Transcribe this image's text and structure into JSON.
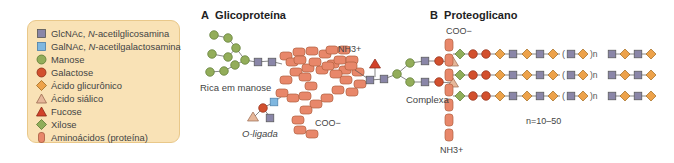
{
  "legend": {
    "items": [
      {
        "symbol": "square",
        "color": "#8a86a8",
        "abbr": "GlcNAc, ",
        "italic": "N",
        "rest": "-acetilglicosamina"
      },
      {
        "symbol": "square",
        "color": "#7fb7e0",
        "abbr": "GalNAc, ",
        "italic": "N",
        "rest": "-acetilgalactosamina"
      },
      {
        "symbol": "circle",
        "color": "#93ad5a",
        "label": "Manose"
      },
      {
        "symbol": "circle",
        "color": "#d2502e",
        "label": "Galactose"
      },
      {
        "symbol": "diamond",
        "color": "#eda24a",
        "label": "Ácido glicurônico"
      },
      {
        "symbol": "triangle",
        "color": "#e6b79a",
        "label": "Ácido siálico"
      },
      {
        "symbol": "triangle",
        "color": "#d2422a",
        "label": "Fucose"
      },
      {
        "symbol": "diamond",
        "color": "#8fae5a",
        "label": "Xilose"
      },
      {
        "symbol": "rounded-rect",
        "color": "#e8876a",
        "label": "Aminoácidos (proteína)"
      }
    ]
  },
  "panel_a": {
    "letter": "A",
    "title": "Glicoproteína",
    "labels": {
      "high_mannose": "Rica em manose",
      "o_linked": "O-ligada",
      "complex": "Complexa",
      "nh3": "NH3+",
      "coo": "COO−"
    }
  },
  "panel_b": {
    "letter": "B",
    "title": "Proteoglicano",
    "labels": {
      "coo": "COO−",
      "nh3": "NH3+",
      "n_range": "n=10–50",
      "repeat_open": "(",
      "repeat_close": ")n"
    },
    "chain_count": 3
  },
  "colors": {
    "glcnac": "#8a86a8",
    "galnac": "#7fb7e0",
    "mannose": "#93ad5a",
    "galactose": "#d2502e",
    "glucuronic": "#eda24a",
    "sialic": "#e6b79a",
    "fucose": "#d2422a",
    "xylose": "#8fae5a",
    "amino": "#e8876a",
    "legend_bg": "#f9e2b6"
  }
}
